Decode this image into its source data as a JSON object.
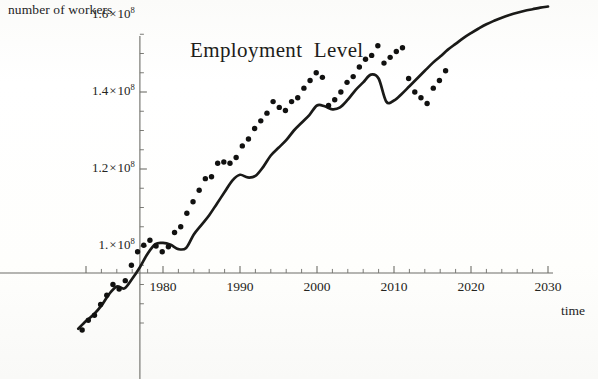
{
  "figure": {
    "title": "Employment  Level",
    "y_axis_caption": "number of workers",
    "x_axis_caption": "time",
    "background_color": "#fdfdfb",
    "curve_color": "#1a1a18",
    "point_color": "#111110"
  },
  "y_ticks": [
    {
      "label_mantissa": "1.6",
      "label_exponent": "8",
      "value": 160000000
    },
    {
      "label_mantissa": "1.4",
      "label_exponent": "8",
      "value": 140000000
    },
    {
      "label_mantissa": "1.2",
      "label_exponent": "8",
      "value": 120000000
    },
    {
      "label_mantissa": "1.",
      "label_exponent": "8",
      "value": 100000000
    }
  ],
  "x_ticks": [
    {
      "label": "1980",
      "value": 1980
    },
    {
      "label": "1990",
      "value": 1990
    },
    {
      "label": "2000",
      "value": 2000
    },
    {
      "label": "2010",
      "value": 2010
    },
    {
      "label": "2020",
      "value": 2020
    },
    {
      "label": "2030",
      "value": 2030
    }
  ],
  "chart_data": {
    "type": "line",
    "title": "Employment  Level",
    "xlabel": "time",
    "ylabel": "number of workers",
    "xlim": [
      1969,
      2031
    ],
    "ylim": [
      78000000,
      168000000
    ],
    "grid": false,
    "legend": null,
    "y_tick_values": [
      100000000,
      120000000,
      140000000,
      160000000
    ],
    "y_tick_labels": [
      "1.×10⁸",
      "1.2×10⁸",
      "1.4×10⁸",
      "1.6×10⁸"
    ],
    "y_minor_tick_step": 5000000,
    "x_tick_values": [
      1980,
      1990,
      2000,
      2010,
      2020,
      2030
    ],
    "x_tick_labels": [
      "1980",
      "1990",
      "2000",
      "2010",
      "2020",
      "2030"
    ],
    "x_minor_tick_step": 2,
    "axis_origin": {
      "x": 1977.0,
      "y": 93000000
    },
    "series": [
      {
        "name": "fitted curve (smooth trend with projection)",
        "style": "solid-line",
        "x": [
          1969.0,
          1970.0,
          1971.0,
          1972.0,
          1973.0,
          1974.0,
          1975.0,
          1976.0,
          1977.0,
          1978.0,
          1979.0,
          1980.0,
          1981.0,
          1982.0,
          1983.0,
          1984.0,
          1985.0,
          1986.0,
          1987.0,
          1988.0,
          1989.0,
          1990.0,
          1991.0,
          1992.0,
          1993.0,
          1994.0,
          1995.0,
          1996.0,
          1997.0,
          1998.0,
          1999.0,
          2000.0,
          2001.0,
          2002.0,
          2003.0,
          2004.0,
          2005.0,
          2006.0,
          2007.0,
          2008.0,
          2009.0,
          2010.0,
          2011.0,
          2012.0,
          2013.0,
          2014.0,
          2015.0,
          2016.0,
          2017.0,
          2018.0,
          2019.0,
          2020.0,
          2021.0,
          2022.0,
          2023.0,
          2024.0,
          2025.0,
          2026.0,
          2027.0,
          2028.0,
          2029.0,
          2030.0
        ],
        "y": [
          78500000,
          80500000,
          82200000,
          84500000,
          87500000,
          89500000,
          89000000,
          91500000,
          94500000,
          98000000,
          100500000,
          100800000,
          100300000,
          99200000,
          99500000,
          103000000,
          105500000,
          108000000,
          111000000,
          114000000,
          117000000,
          118500000,
          117800000,
          118200000,
          120500000,
          123500000,
          125500000,
          127500000,
          130000000,
          132000000,
          134000000,
          136500000,
          136300000,
          135500000,
          136000000,
          138000000,
          140500000,
          142500000,
          144500000,
          143500000,
          137500000,
          137800000,
          139500000,
          141500000,
          143500000,
          145500000,
          147500000,
          149200000,
          151000000,
          152500000,
          154000000,
          155300000,
          156500000,
          157600000,
          158500000,
          159300000,
          160000000,
          160600000,
          161100000,
          161500000,
          161900000,
          162200000
        ]
      },
      {
        "name": "observed data points",
        "style": "points",
        "x": [
          1969.5,
          1970.3,
          1971.1,
          1971.9,
          1972.7,
          1973.5,
          1974.3,
          1975.1,
          1975.9,
          1976.7,
          1977.5,
          1978.3,
          1979.1,
          1979.9,
          1980.7,
          1981.5,
          1982.3,
          1983.1,
          1983.9,
          1984.7,
          1985.5,
          1986.3,
          1987.1,
          1987.9,
          1988.7,
          1989.5,
          1990.3,
          1991.1,
          1991.9,
          1992.7,
          1993.5,
          1994.3,
          1995.1,
          1995.9,
          1996.7,
          1997.5,
          1998.3,
          1999.1,
          1999.9,
          2000.7,
          2001.5,
          2002.3,
          2003.1,
          2003.9,
          2004.7,
          2005.5,
          2006.3,
          2007.1,
          2007.9,
          2008.7,
          2009.5,
          2010.3,
          2011.1,
          2011.9,
          2012.7,
          2013.5,
          2014.3,
          2015.1,
          2015.9,
          2016.7
        ],
        "y": [
          78200000,
          80700000,
          82000000,
          84800000,
          87200000,
          90000000,
          88800000,
          91000000,
          95000000,
          98500000,
          100200000,
          101500000,
          100000000,
          98500000,
          99800000,
          103500000,
          105000000,
          108500000,
          111500000,
          114500000,
          117500000,
          118000000,
          121500000,
          121800000,
          121500000,
          123000000,
          126000000,
          127800000,
          130500000,
          132500000,
          134500000,
          137500000,
          136000000,
          135200000,
          137500000,
          138500000,
          141000000,
          143000000,
          145000000,
          143800000,
          136500000,
          138000000,
          140000000,
          142500000,
          144000000,
          146500000,
          148500000,
          149500000,
          152000000,
          147500000,
          149000000,
          150500000,
          151500000,
          143500000,
          140000000,
          138500000,
          137000000,
          141000000,
          143000000,
          145500000
        ]
      }
    ],
    "notes": [
      "Smooth fitted trend with projection extending to 2030",
      "Scatter points end around 2017",
      "Visible recession dips near 1980-1983, 1991, 2002, 2008-2010"
    ]
  }
}
